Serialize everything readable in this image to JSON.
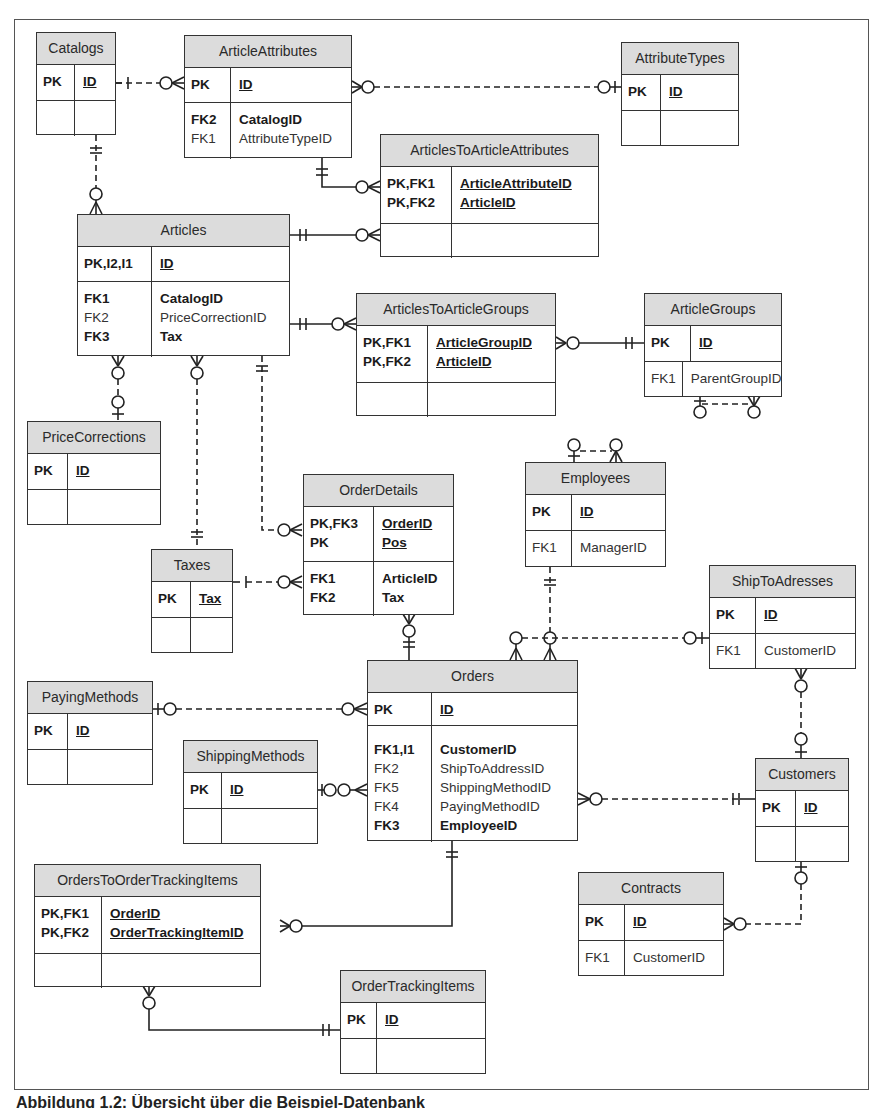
{
  "diagram": {
    "type": "entity-relationship",
    "caption": "Abbildung 1.2: Übersicht über die Beispiel-Datenbank"
  },
  "entities": {
    "catalogs": {
      "title": "Catalogs",
      "pk": [
        {
          "key": "PK",
          "col": "ID"
        }
      ],
      "attrs": []
    },
    "articleAttributes": {
      "title": "ArticleAttributes",
      "pk": [
        {
          "key": "PK",
          "col": "ID"
        }
      ],
      "attrs": [
        {
          "key": "FK2",
          "col": "CatalogID",
          "bold": true
        },
        {
          "key": "FK1",
          "col": "AttributeTypeID",
          "bold": false
        }
      ]
    },
    "attributeTypes": {
      "title": "AttributeTypes",
      "pk": [
        {
          "key": "PK",
          "col": "ID"
        }
      ],
      "attrs": []
    },
    "articlesToArticleAttributes": {
      "title": "ArticlesToArticleAttributes",
      "pk": [
        {
          "key": "PK,FK1",
          "col": "ArticleAttributeID"
        },
        {
          "key": "PK,FK2",
          "col": "ArticleID"
        }
      ],
      "attrs": []
    },
    "articles": {
      "title": "Articles",
      "pk": [
        {
          "key": "PK,I2,I1",
          "col": "ID"
        }
      ],
      "attrs": [
        {
          "key": "FK1",
          "col": "CatalogID",
          "bold": true
        },
        {
          "key": "FK2",
          "col": "PriceCorrectionID",
          "bold": false
        },
        {
          "key": "FK3",
          "col": "Tax",
          "bold": true
        }
      ]
    },
    "articlesToArticleGroups": {
      "title": "ArticlesToArticleGroups",
      "pk": [
        {
          "key": "PK,FK1",
          "col": "ArticleGroupID"
        },
        {
          "key": "PK,FK2",
          "col": "ArticleID"
        }
      ],
      "attrs": []
    },
    "articleGroups": {
      "title": "ArticleGroups",
      "pk": [
        {
          "key": "PK",
          "col": "ID"
        }
      ],
      "attrs": [
        {
          "key": "FK1",
          "col": "ParentGroupID",
          "bold": false
        }
      ]
    },
    "priceCorrections": {
      "title": "PriceCorrections",
      "pk": [
        {
          "key": "PK",
          "col": "ID"
        }
      ],
      "attrs": []
    },
    "orderDetails": {
      "title": "OrderDetails",
      "pk": [
        {
          "key": "PK,FK3",
          "col": "OrderID"
        },
        {
          "key": "PK",
          "col": "Pos"
        }
      ],
      "attrs": [
        {
          "key": "FK1",
          "col": "ArticleID",
          "bold": true
        },
        {
          "key": "FK2",
          "col": "Tax",
          "bold": true
        }
      ]
    },
    "employees": {
      "title": "Employees",
      "pk": [
        {
          "key": "PK",
          "col": "ID"
        }
      ],
      "attrs": [
        {
          "key": "FK1",
          "col": "ManagerID",
          "bold": false
        }
      ]
    },
    "taxes": {
      "title": "Taxes",
      "pk": [
        {
          "key": "PK",
          "col": "Tax"
        }
      ],
      "attrs": []
    },
    "shipToAdresses": {
      "title": "ShipToAdresses",
      "pk": [
        {
          "key": "PK",
          "col": "ID"
        }
      ],
      "attrs": [
        {
          "key": "FK1",
          "col": "CustomerID",
          "bold": false
        }
      ]
    },
    "payingMethods": {
      "title": "PayingMethods",
      "pk": [
        {
          "key": "PK",
          "col": "ID"
        }
      ],
      "attrs": []
    },
    "orders": {
      "title": "Orders",
      "pk": [
        {
          "key": "PK",
          "col": "ID"
        }
      ],
      "attrs": [
        {
          "key": "FK1,I1",
          "col": "CustomerID",
          "bold": true
        },
        {
          "key": "FK2",
          "col": "ShipToAddressID",
          "bold": false
        },
        {
          "key": "FK5",
          "col": "ShippingMethodID",
          "bold": false
        },
        {
          "key": "FK4",
          "col": "PayingMethodID",
          "bold": false
        },
        {
          "key": "FK3",
          "col": "EmployeeID",
          "bold": true
        }
      ]
    },
    "shippingMethods": {
      "title": "ShippingMethods",
      "pk": [
        {
          "key": "PK",
          "col": "ID"
        }
      ],
      "attrs": []
    },
    "customers": {
      "title": "Customers",
      "pk": [
        {
          "key": "PK",
          "col": "ID"
        }
      ],
      "attrs": []
    },
    "ordersToOrderTrackingItems": {
      "title": "OrdersToOrderTrackingItems",
      "pk": [
        {
          "key": "PK,FK1",
          "col": "OrderID"
        },
        {
          "key": "PK,FK2",
          "col": "OrderTrackingItemID"
        }
      ],
      "attrs": []
    },
    "contracts": {
      "title": "Contracts",
      "pk": [
        {
          "key": "PK",
          "col": "ID"
        }
      ],
      "attrs": [
        {
          "key": "FK1",
          "col": "CustomerID",
          "bold": false
        }
      ]
    },
    "orderTrackingItems": {
      "title": "OrderTrackingItems",
      "pk": [
        {
          "key": "PK",
          "col": "ID"
        }
      ],
      "attrs": []
    }
  },
  "relationships": [
    {
      "from": "Catalogs",
      "to": "ArticleAttributes",
      "cardinality": "one-to-zero-or-many",
      "line": "dashed"
    },
    {
      "from": "AttributeTypes",
      "to": "ArticleAttributes",
      "cardinality": "zero-or-one-to-zero-or-many",
      "line": "dashed"
    },
    {
      "from": "ArticleAttributes",
      "to": "ArticlesToArticleAttributes",
      "cardinality": "one-to-zero-or-many",
      "line": "solid"
    },
    {
      "from": "Articles",
      "to": "ArticlesToArticleAttributes",
      "cardinality": "one-to-zero-or-many",
      "line": "solid"
    },
    {
      "from": "Catalogs",
      "to": "Articles",
      "cardinality": "one-to-zero-or-many",
      "line": "dashed"
    },
    {
      "from": "Articles",
      "to": "ArticlesToArticleGroups",
      "cardinality": "one-to-zero-or-many",
      "line": "solid"
    },
    {
      "from": "ArticleGroups",
      "to": "ArticlesToArticleGroups",
      "cardinality": "one-to-zero-or-many",
      "line": "solid"
    },
    {
      "from": "ArticleGroups",
      "to": "ArticleGroups",
      "cardinality": "zero-or-one-to-zero-or-many",
      "line": "dashed"
    },
    {
      "from": "PriceCorrections",
      "to": "Articles",
      "cardinality": "zero-or-one-to-zero-or-many",
      "line": "dashed"
    },
    {
      "from": "Taxes",
      "to": "Articles",
      "cardinality": "one-to-zero-or-many",
      "line": "dashed"
    },
    {
      "from": "Articles",
      "to": "OrderDetails",
      "cardinality": "one-to-zero-or-many",
      "line": "dashed"
    },
    {
      "from": "Taxes",
      "to": "OrderDetails",
      "cardinality": "one-to-zero-or-many",
      "line": "dashed"
    },
    {
      "from": "Orders",
      "to": "OrderDetails",
      "cardinality": "one-to-zero-or-many",
      "line": "solid"
    },
    {
      "from": "Employees",
      "to": "Employees",
      "cardinality": "zero-or-one-to-zero-or-many",
      "line": "dashed"
    },
    {
      "from": "Employees",
      "to": "Orders",
      "cardinality": "one-to-zero-or-many",
      "line": "dashed"
    },
    {
      "from": "ShipToAdresses",
      "to": "Orders",
      "cardinality": "zero-or-one-to-zero-or-many",
      "line": "dashed"
    },
    {
      "from": "PayingMethods",
      "to": "Orders",
      "cardinality": "zero-or-one-to-zero-or-many",
      "line": "dashed"
    },
    {
      "from": "ShippingMethods",
      "to": "Orders",
      "cardinality": "zero-or-one-to-zero-or-many",
      "line": "solid"
    },
    {
      "from": "Customers",
      "to": "Orders",
      "cardinality": "one-to-zero-or-many",
      "line": "dashed"
    },
    {
      "from": "Customers",
      "to": "ShipToAdresses",
      "cardinality": "zero-or-one-to-zero-or-many",
      "line": "dashed"
    },
    {
      "from": "Customers",
      "to": "Contracts",
      "cardinality": "zero-or-one-to-zero-or-many",
      "line": "dashed"
    },
    {
      "from": "Orders",
      "to": "OrdersToOrderTrackingItems",
      "cardinality": "one-to-zero-or-many",
      "line": "solid"
    },
    {
      "from": "OrderTrackingItems",
      "to": "OrdersToOrderTrackingItems",
      "cardinality": "one-to-zero-or-many",
      "line": "solid"
    }
  ]
}
